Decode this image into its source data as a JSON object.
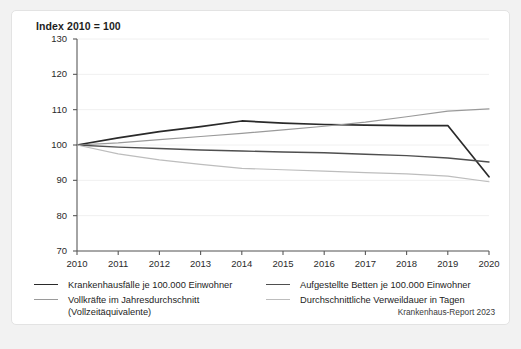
{
  "card": {
    "title": "Index 2010 = 100",
    "source_note": "Krankenhaus-Report 2023"
  },
  "legend": {
    "entries": [
      {
        "label": "Krankenhausfälle je 100.000 Einwohner",
        "color": "#2a2a2a",
        "column": "left"
      },
      {
        "label": "Vollkräfte im Jahresdurchschnitt (Vollzeitäquivalente)",
        "color": "#9a9a9a",
        "column": "left"
      },
      {
        "label": "Aufgestellte Betten je 100.000 Einwohner",
        "color": "#4f4f4f",
        "column": "right"
      },
      {
        "label": "Durchschnittliche Verweildauer in Tagen",
        "color": "#bdbdbd",
        "column": "right"
      }
    ]
  },
  "chart_data": {
    "type": "line",
    "title": "Index 2010 = 100",
    "xlabel": "",
    "ylabel": "",
    "x": [
      2010,
      2011,
      2012,
      2013,
      2014,
      2015,
      2016,
      2017,
      2018,
      2019,
      2020
    ],
    "xtick_labels": [
      "2010",
      "2011",
      "2012",
      "2013",
      "2014",
      "2015",
      "2016",
      "2017",
      "2018",
      "2019",
      "2020"
    ],
    "ytick_labels": [
      "70",
      "80",
      "90",
      "100",
      "110",
      "120",
      "130"
    ],
    "ylim": [
      70,
      130
    ],
    "ytick_values": [
      70,
      80,
      90,
      100,
      110,
      120,
      130
    ],
    "grid": true,
    "legend_position": "below",
    "series": [
      {
        "name": "Krankenhausfälle je 100.000 Einwohner",
        "color": "#2a2a2a",
        "width": 1.7,
        "values": [
          100.0,
          102.0,
          103.8,
          105.2,
          106.8,
          106.2,
          105.8,
          105.6,
          105.5,
          105.5,
          91.0
        ]
      },
      {
        "name": "Vollkräfte im Jahresdurchschnitt (Vollzeitäquivalente)",
        "color": "#9a9a9a",
        "width": 1.2,
        "values": [
          100.0,
          100.6,
          101.5,
          102.4,
          103.3,
          104.3,
          105.3,
          106.5,
          108.0,
          109.6,
          110.2
        ]
      },
      {
        "name": "Aufgestellte Betten je 100.000 Einwohner",
        "color": "#4f4f4f",
        "width": 1.4,
        "values": [
          100.0,
          99.4,
          99.0,
          98.6,
          98.3,
          98.0,
          97.8,
          97.4,
          97.0,
          96.3,
          95.2
        ]
      },
      {
        "name": "Durchschnittliche Verweildauer in Tagen",
        "color": "#bdbdbd",
        "width": 1.2,
        "values": [
          100.0,
          97.5,
          95.8,
          94.5,
          93.4,
          93.0,
          92.6,
          92.2,
          91.8,
          91.2,
          89.6
        ]
      }
    ],
    "verweildauer_rising_note": null
  },
  "axes": {
    "axis_color": "#595959",
    "grid_color": "#f0f0f0"
  }
}
